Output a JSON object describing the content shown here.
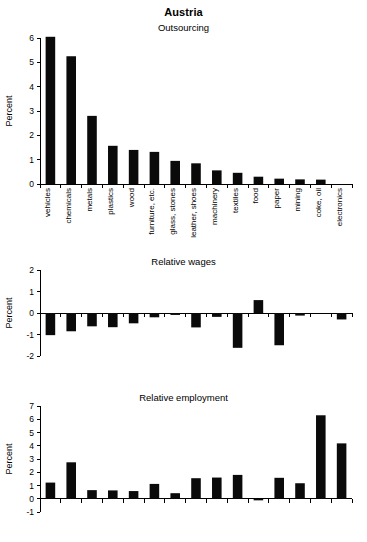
{
  "figure": {
    "title": "Austria",
    "axis_label": "Percent",
    "bar_color": "#0a0a0a",
    "background": "#ffffff"
  },
  "categories": [
    "vehicles",
    "chemicals",
    "metals",
    "plastics",
    "wood",
    "furniture, etc.",
    "glass, stones",
    "leather, shoes",
    "machinery",
    "textiles",
    "food",
    "paper",
    "mining",
    "coke, oil",
    "electronics"
  ],
  "panels": [
    {
      "id": "outsourcing",
      "title": "Outsourcing",
      "ylabel": "Percent",
      "ylim": [
        0,
        6
      ],
      "yticks": [
        0,
        1,
        2,
        3,
        4,
        5,
        6
      ],
      "show_category_labels": true
    },
    {
      "id": "relative-wages",
      "title": "Relative wages",
      "ylabel": "Percent",
      "ylim": [
        -2,
        2
      ],
      "yticks": [
        -2,
        -1,
        0,
        1,
        2
      ],
      "show_category_labels": false
    },
    {
      "id": "relative-employment",
      "title": "Relative employment",
      "ylabel": "Percent",
      "ylim": [
        -1,
        7
      ],
      "yticks": [
        -1,
        0,
        1,
        2,
        3,
        4,
        5,
        6,
        7
      ],
      "show_category_labels": false
    }
  ],
  "chart_data": [
    {
      "type": "bar",
      "title": "Outsourcing",
      "subtitle": "Austria",
      "xlabel": "",
      "ylabel": "Percent",
      "ylim": [
        0,
        6
      ],
      "yticks": [
        0,
        1,
        2,
        3,
        4,
        5,
        6
      ],
      "grid": false,
      "legend": false,
      "categories": [
        "vehicles",
        "chemicals",
        "metals",
        "plastics",
        "wood",
        "furniture, etc.",
        "glass, stones",
        "leather, shoes",
        "machinery",
        "textiles",
        "food",
        "paper",
        "mining",
        "coke, oil",
        "electronics"
      ],
      "values": [
        6.05,
        5.25,
        2.8,
        1.57,
        1.4,
        1.32,
        0.95,
        0.85,
        0.56,
        0.46,
        0.3,
        0.22,
        0.19,
        0.18,
        0.0
      ]
    },
    {
      "type": "bar",
      "title": "Relative wages",
      "subtitle": "Austria",
      "xlabel": "",
      "ylabel": "Percent",
      "ylim": [
        -2,
        2
      ],
      "yticks": [
        -2,
        -1,
        0,
        1,
        2
      ],
      "grid": false,
      "legend": false,
      "categories": [
        "vehicles",
        "chemicals",
        "metals",
        "plastics",
        "wood",
        "furniture, etc.",
        "glass, stones",
        "leather, shoes",
        "machinery",
        "textiles",
        "food",
        "paper",
        "mining",
        "coke, oil",
        "electronics"
      ],
      "values": [
        -1.03,
        -0.85,
        -0.62,
        -0.66,
        -0.48,
        -0.2,
        -0.09,
        -0.67,
        -0.18,
        -1.62,
        0.6,
        -1.5,
        -0.12,
        0.0,
        -0.3
      ]
    },
    {
      "type": "bar",
      "title": "Relative employment",
      "subtitle": "Austria",
      "xlabel": "",
      "ylabel": "Percent",
      "ylim": [
        -1,
        7
      ],
      "yticks": [
        -1,
        0,
        1,
        2,
        3,
        4,
        5,
        6,
        7
      ],
      "grid": false,
      "legend": false,
      "categories": [
        "vehicles",
        "chemicals",
        "metals",
        "plastics",
        "wood",
        "furniture, etc.",
        "glass, stones",
        "leather, shoes",
        "machinery",
        "textiles",
        "food",
        "paper",
        "mining",
        "coke, oil",
        "electronics"
      ],
      "values": [
        1.22,
        2.75,
        0.65,
        0.63,
        0.58,
        1.12,
        0.42,
        1.55,
        1.6,
        1.8,
        -0.12,
        1.58,
        1.17,
        6.3,
        4.18
      ]
    }
  ]
}
